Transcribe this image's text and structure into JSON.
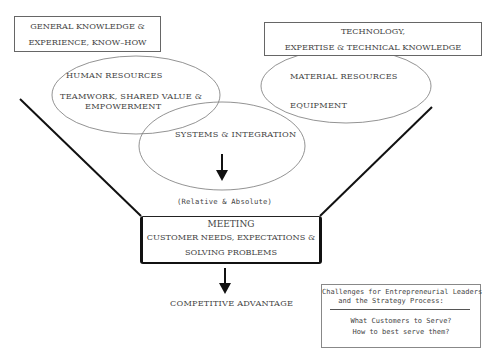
{
  "diagram": {
    "knowledge_box": {
      "line1": "GENERAL KNOWLEDGE &",
      "line2": "EXPERIENCE, KNOW–HOW"
    },
    "technology_box": {
      "line1": "TECHNOLOGY,",
      "line2": "EXPERTISE & TECHNICAL KNOWLEDGE"
    },
    "human_resources": {
      "title": "HUMAN RESOURCES",
      "line1": "TEAMWORK, SHARED VALUE &",
      "line2": "EMPOWERMENT"
    },
    "material_resources": {
      "title": "MATERIAL RESOURCES",
      "line1": "EQUIPMENT"
    },
    "systems": {
      "title": "SYSTEMS & INTEGRATION"
    },
    "relative_label": "(Relative & Absolute)",
    "meeting_box": {
      "line1": "MEETING",
      "line2": "CUSTOMER NEEDS, EXPECTATIONS &",
      "line3": "SOLVING PROBLEMS"
    },
    "outcome": "COMPETITIVE ADVANTAGE",
    "challenges_box": {
      "title_line1": "Challenges for Entrepreneurial Leaders",
      "title_line2": "and the Strategy Process:",
      "q1": "What Customers to Serve?",
      "q2": "How to best serve them?"
    }
  }
}
